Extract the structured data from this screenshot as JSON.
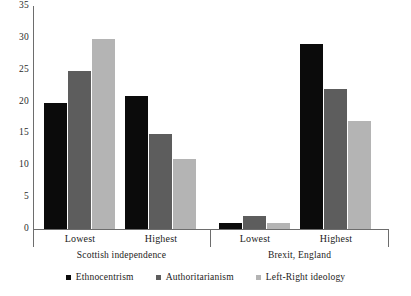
{
  "chart_data": {
    "type": "bar",
    "title": "",
    "subtitle": "",
    "xlabel": "",
    "ylabel": "",
    "ylim": [
      0,
      35
    ],
    "yticks": [
      0,
      5,
      10,
      15,
      20,
      25,
      30,
      35
    ],
    "grid": false,
    "legend_position": "bottom",
    "panels": [
      {
        "name": "Scottish independence",
        "categories": [
          "Lowest",
          "Highest"
        ]
      },
      {
        "name": "Brexit, England",
        "categories": [
          "Lowest",
          "Highest"
        ]
      }
    ],
    "categories": [
      "Lowest",
      "Highest",
      "Lowest",
      "Highest"
    ],
    "series": [
      {
        "name": "Ethnocentrism",
        "color": "#0b0b0b",
        "values": [
          19.7,
          20.8,
          1.0,
          29.0
        ]
      },
      {
        "name": "Authoritarianism",
        "color": "#5d5d5d",
        "values": [
          24.8,
          14.9,
          2.0,
          22.0
        ]
      },
      {
        "name": "Left-Right ideology",
        "color": "#b4b4b4",
        "values": [
          29.8,
          11.0,
          1.0,
          17.0
        ]
      }
    ]
  },
  "axis": {
    "tick_labels": [
      "35",
      "30",
      "25",
      "20",
      "15",
      "10",
      "5",
      "0"
    ]
  },
  "categories": {
    "g0": "Lowest",
    "g1": "Highest",
    "g2": "Lowest",
    "g3": "Highest"
  },
  "panels": {
    "p0": "Scottish independence",
    "p1": "Brexit, England"
  },
  "legend": {
    "items": [
      {
        "label": "Ethnocentrism"
      },
      {
        "label": "Authoritarianism"
      },
      {
        "label": "Left-Right ideology"
      }
    ]
  }
}
